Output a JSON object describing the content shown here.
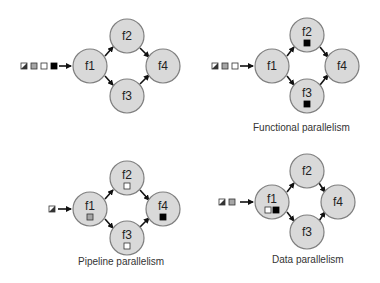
{
  "diagrams": [
    {
      "id": "sequential",
      "caption": "",
      "nodes": [
        {
          "label": "f1",
          "x": 90,
          "y": 66,
          "tokens": []
        },
        {
          "label": "f2",
          "x": 127,
          "y": 36,
          "tokens": []
        },
        {
          "label": "f3",
          "x": 127,
          "y": 96,
          "tokens": []
        },
        {
          "label": "f4",
          "x": 163,
          "y": 66,
          "tokens": []
        }
      ],
      "queue": [
        "hatch",
        "gray",
        "white",
        "black"
      ]
    },
    {
      "id": "functional",
      "caption": "Functional parallelism",
      "nodes": [
        {
          "label": "f1",
          "x": 272,
          "y": 66,
          "tokens": []
        },
        {
          "label": "f2",
          "x": 307,
          "y": 35,
          "tokens": [
            "black"
          ]
        },
        {
          "label": "f3",
          "x": 307,
          "y": 96,
          "tokens": [
            "black"
          ]
        },
        {
          "label": "f4",
          "x": 342,
          "y": 66,
          "tokens": []
        }
      ],
      "queue": [
        "hatch",
        "gray",
        "white"
      ]
    },
    {
      "id": "pipeline",
      "caption": "Pipeline parallelism",
      "nodes": [
        {
          "label": "f1",
          "x": 90,
          "y": 209,
          "tokens": [
            "gray"
          ]
        },
        {
          "label": "f2",
          "x": 127,
          "y": 178,
          "tokens": [
            "white"
          ]
        },
        {
          "label": "f3",
          "x": 127,
          "y": 238,
          "tokens": [
            "white"
          ]
        },
        {
          "label": "f4",
          "x": 163,
          "y": 209,
          "tokens": [
            "black"
          ]
        }
      ],
      "queue": [
        "hatch"
      ]
    },
    {
      "id": "data",
      "caption": "Data parallelism",
      "nodes": [
        {
          "label": "f1",
          "x": 272,
          "y": 202,
          "tokens": [
            "white",
            "black"
          ]
        },
        {
          "label": "f2",
          "x": 307,
          "y": 171,
          "tokens": []
        },
        {
          "label": "f3",
          "x": 307,
          "y": 232,
          "tokens": []
        },
        {
          "label": "f4",
          "x": 338,
          "y": 202,
          "tokens": []
        }
      ],
      "queue": [
        "hatch",
        "gray"
      ]
    }
  ],
  "captions": {
    "functional": "Functional parallelism",
    "pipeline": "Pipeline parallelism",
    "data": "Data parallelism"
  },
  "labels": {
    "f1": "f1",
    "f2": "f2",
    "f3": "f3",
    "f4": "f4"
  }
}
